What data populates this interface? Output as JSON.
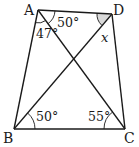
{
  "diagram": {
    "type": "quadrilateral-with-diagonals",
    "vertices": [
      {
        "name": "A",
        "x": 38,
        "y": 10
      },
      {
        "name": "D",
        "x": 112,
        "y": 14
      },
      {
        "name": "C",
        "x": 125,
        "y": 129
      },
      {
        "name": "B",
        "x": 14,
        "y": 129
      }
    ],
    "segments": [
      "AB",
      "BC",
      "CD",
      "DA",
      "AC",
      "BD"
    ],
    "labels": {
      "A": "A",
      "B": "B",
      "C": "C",
      "D": "D"
    },
    "angles": {
      "DAC": "50°",
      "BAC": "47°",
      "ADB": "x",
      "DBC": "50°",
      "ACB": "55°"
    },
    "colors": {
      "line": "#1a1a1a",
      "shade": "#d9d9d9",
      "background": "#ffffff"
    }
  }
}
